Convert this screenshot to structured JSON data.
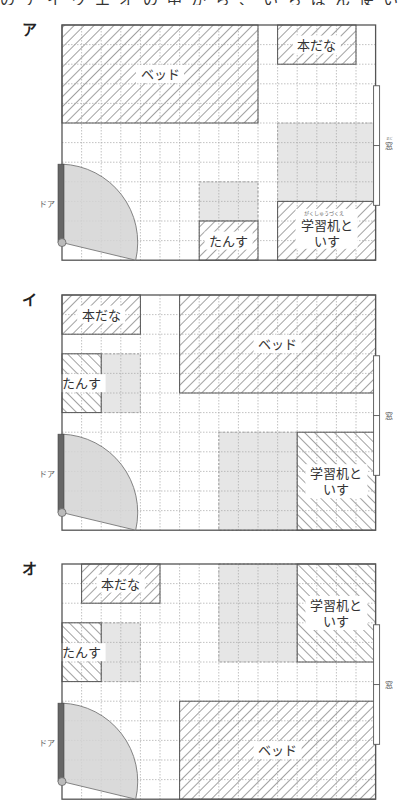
{
  "header": {
    "cut_off_question_text": "のアイウエオの中から、いちばん使いやすい部屋の配置を選びましょう。"
  },
  "grid": {
    "cols": 16,
    "rows": 12,
    "cell": 19.6
  },
  "colors": {
    "border": "#555555",
    "grid_line": "#a8a8a8",
    "hatch": "#555555",
    "gray_area": "#e6e6e6",
    "door_bar": "#666666",
    "door_arc_fill": "#d4d4d4",
    "label_bg": "#ffffff",
    "text": "#333333"
  },
  "labels": {
    "door": "ドア",
    "window": "窓",
    "window_ruby": "まど",
    "desk_ruby": "がくしゅうづくえ"
  },
  "diagrams": [
    {
      "id": "a",
      "option_label": "ア",
      "origin": [
        62,
        25
      ],
      "window": {
        "row_start": 3.1,
        "row_end": 9.2
      },
      "door": {
        "row_top": 7.1,
        "row_hinge": 11.1
      },
      "gray_areas": [
        {
          "c": 11,
          "r": 5,
          "w": 5,
          "h": 4
        },
        {
          "c": 7,
          "r": 8,
          "w": 3,
          "h": 2
        }
      ],
      "furniture": [
        {
          "name": "bed",
          "label": "ベッド",
          "c": 0,
          "r": 0,
          "w": 10,
          "h": 5,
          "hatch": "fwd",
          "lines": [
            "ベッド"
          ]
        },
        {
          "name": "bookshelf",
          "label": "本だな",
          "c": 11,
          "r": 0,
          "w": 4,
          "h": 2,
          "hatch": "fwd",
          "lines": [
            "本だな"
          ]
        },
        {
          "name": "desk-and-chair",
          "label": "学習机といす",
          "c": 11,
          "r": 9,
          "w": 5,
          "h": 3,
          "hatch": "fwd",
          "lines": [
            "学習机と",
            "いす"
          ],
          "ruby": true
        },
        {
          "name": "dresser",
          "label": "たんす",
          "c": 7,
          "r": 10,
          "w": 3,
          "h": 2,
          "hatch": "fwd",
          "lines": [
            "たんす"
          ]
        }
      ]
    },
    {
      "id": "i",
      "option_label": "イ",
      "origin": [
        62,
        295
      ],
      "window": {
        "row_start": 3.1,
        "row_end": 9.2
      },
      "door": {
        "row_top": 7.1,
        "row_hinge": 11.1
      },
      "gray_areas": [
        {
          "c": 2,
          "r": 3,
          "w": 2,
          "h": 3
        },
        {
          "c": 8,
          "r": 7,
          "w": 4,
          "h": 5
        }
      ],
      "furniture": [
        {
          "name": "bookshelf",
          "label": "本だな",
          "c": 0,
          "r": 0,
          "w": 4,
          "h": 2,
          "hatch": "fwd",
          "lines": [
            "本だな"
          ]
        },
        {
          "name": "bed",
          "label": "ベッド",
          "c": 6,
          "r": 0,
          "w": 10,
          "h": 5,
          "hatch": "fwd",
          "lines": [
            "ベッド"
          ]
        },
        {
          "name": "dresser",
          "label": "たんす",
          "c": 0,
          "r": 3,
          "w": 2,
          "h": 3,
          "hatch": "back",
          "lines": [
            "たんす"
          ]
        },
        {
          "name": "desk-and-chair",
          "label": "学習机といす",
          "c": 12,
          "r": 7,
          "w": 4,
          "h": 5,
          "hatch": "back",
          "lines": [
            "学習机と",
            "いす"
          ]
        }
      ]
    },
    {
      "id": "o",
      "option_label": "オ",
      "origin": [
        62,
        564
      ],
      "window": {
        "row_start": 3.1,
        "row_end": 9.2
      },
      "door": {
        "row_top": 7.1,
        "row_hinge": 11.1
      },
      "gray_areas": [
        {
          "c": 2,
          "r": 3,
          "w": 2,
          "h": 3
        },
        {
          "c": 8,
          "r": 0,
          "w": 4,
          "h": 5
        }
      ],
      "furniture": [
        {
          "name": "bookshelf",
          "label": "本だな",
          "c": 1,
          "r": 0,
          "w": 4,
          "h": 2,
          "hatch": "fwd",
          "lines": [
            "本だな"
          ]
        },
        {
          "name": "desk-and-chair",
          "label": "学習机といす",
          "c": 12,
          "r": 0,
          "w": 4,
          "h": 5,
          "hatch": "back",
          "lines": [
            "学習机と",
            "いす"
          ]
        },
        {
          "name": "dresser",
          "label": "たんす",
          "c": 0,
          "r": 3,
          "w": 2,
          "h": 3,
          "hatch": "back",
          "lines": [
            "たんす"
          ]
        },
        {
          "name": "bed",
          "label": "ベッド",
          "c": 6,
          "r": 7,
          "w": 10,
          "h": 5,
          "hatch": "fwd",
          "lines": [
            "ベッド"
          ]
        }
      ]
    }
  ]
}
